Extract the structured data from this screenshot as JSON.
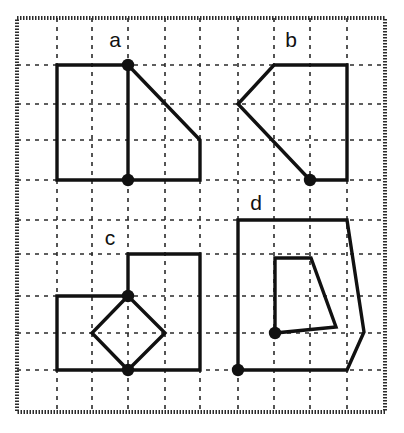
{
  "figure": {
    "width": 404,
    "height": 433,
    "background_color": "#ffffff",
    "stroke_color": "#111111",
    "grid_color": "#2b2b2b",
    "frame": {
      "x": 17,
      "y": 18,
      "width": 368,
      "height": 394
    },
    "grid": {
      "spacing": 37,
      "style": "dotted",
      "x_lines": [
        57,
        92,
        128,
        165,
        200,
        238,
        274,
        310,
        347
      ],
      "y_lines": [
        65,
        104,
        140,
        180,
        220,
        254,
        296,
        333,
        370
      ]
    },
    "labels": [
      {
        "id": "label-a",
        "text": "a",
        "x": 115,
        "y": 41
      },
      {
        "id": "label-b",
        "text": "b",
        "x": 291,
        "y": 41
      },
      {
        "id": "label-c",
        "text": "c",
        "x": 110,
        "y": 239
      },
      {
        "id": "label-d",
        "text": "d",
        "x": 256,
        "y": 204
      }
    ],
    "panels": [
      {
        "id": "panel-a",
        "label": "a",
        "outline": "57,65 128,65 200,140 200,180 57,180",
        "segments": [
          "128,65 128,180"
        ],
        "dots": [
          {
            "x": 128,
            "y": 65
          },
          {
            "x": 128,
            "y": 180
          }
        ]
      },
      {
        "id": "panel-b",
        "label": "b",
        "outline": "274,65 347,65 347,180 310,180 238,104",
        "segments": [],
        "dots": [
          {
            "x": 310,
            "y": 180
          }
        ]
      },
      {
        "id": "panel-c",
        "label": "c",
        "outline": "128,254 200,254 200,370 57,370 57,296 128,296",
        "segments": [
          "128,296 165,333 128,370 92,333 128,296"
        ],
        "dots": [
          {
            "x": 128,
            "y": 296
          },
          {
            "x": 128,
            "y": 370
          }
        ]
      },
      {
        "id": "panel-d",
        "label": "d",
        "outline": "238,220 347,220 364,332 347,370 238,370",
        "segments": [
          "275,258 311,258 336,327 275,333 275,258"
        ],
        "dots": [
          {
            "x": 238,
            "y": 370
          },
          {
            "x": 275,
            "y": 333
          }
        ]
      }
    ]
  }
}
